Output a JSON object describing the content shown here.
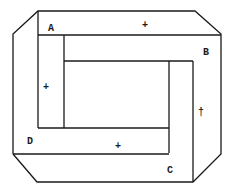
{
  "diagram": {
    "type": "impossible-frame",
    "labels": [
      {
        "id": "A",
        "text": "A",
        "x": 48,
        "y": 31
      },
      {
        "id": "B",
        "text": "B",
        "x": 203,
        "y": 55
      },
      {
        "id": "C",
        "text": "C",
        "x": 167,
        "y": 173
      },
      {
        "id": "D",
        "text": "D",
        "x": 27,
        "y": 144
      }
    ],
    "markers": [
      {
        "id": "plus-top",
        "text": "+",
        "x": 142,
        "y": 28
      },
      {
        "id": "plus-left",
        "text": "+",
        "x": 43,
        "y": 90
      },
      {
        "id": "plus-right",
        "text": "†",
        "x": 198,
        "y": 115
      },
      {
        "id": "plus-bottom",
        "text": "+",
        "x": 115,
        "y": 149
      }
    ],
    "stroke_color": "#1a1a1a",
    "background": "#ffffff"
  }
}
